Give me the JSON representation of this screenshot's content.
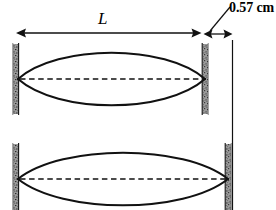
{
  "figure": {
    "kind": "physics-diagram",
    "background_color": "#ffffff",
    "ink_color": "#000000",
    "wall_color": "#8a8a8a",
    "labels": {
      "length_label": "L",
      "gap_label": "0.57 cm"
    },
    "dimensions": {
      "length_arrow": {
        "name": "L",
        "value_text": "L",
        "x_start": 16,
        "x_end": 201,
        "y": 33
      },
      "gap_arrow": {
        "name": "0.57 cm",
        "value_text": "0.57 cm",
        "value_number": 0.57,
        "unit": "cm",
        "x_start": 204,
        "x_end": 232,
        "y": 34
      }
    },
    "waves": [
      {
        "name": "upper-standing-wave",
        "left_node_x": 18,
        "right_node_x": 205,
        "axis_y": 79,
        "amplitude": 32
      },
      {
        "name": "lower-standing-wave",
        "left_node_x": 18,
        "right_node_x": 228,
        "axis_y": 179,
        "amplitude": 32
      }
    ],
    "walls": [
      {
        "name": "upper-left-wall",
        "x": 16,
        "y_top": 44,
        "y_bottom": 114
      },
      {
        "name": "upper-right-wall",
        "x": 205,
        "y_top": 44,
        "y_bottom": 114
      },
      {
        "name": "lower-left-wall",
        "x": 16,
        "y_top": 144,
        "y_bottom": 210
      },
      {
        "name": "lower-right-wall",
        "x": 228,
        "y_top": 144,
        "y_bottom": 210
      }
    ],
    "reference_line": {
      "name": "right-reference-line",
      "x": 232,
      "y_top": 40,
      "y_bottom": 210
    },
    "leader_line": {
      "name": "gap-leader-line",
      "x_start": 210,
      "y_start": 30,
      "x_end": 229,
      "y_end": 8
    }
  }
}
